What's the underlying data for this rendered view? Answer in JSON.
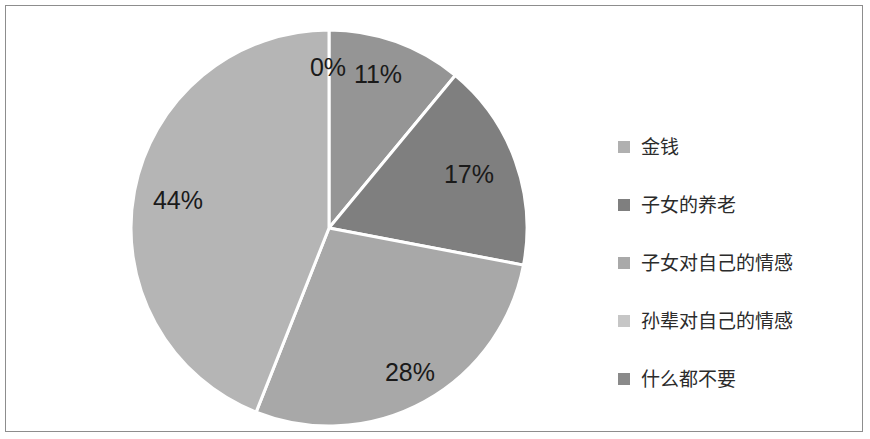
{
  "figure": {
    "background": "#ffffff",
    "border_color": "#8d8d8d"
  },
  "legend": {
    "position": "right",
    "items": [
      {
        "label": "金钱",
        "color": "#b0b0b0",
        "name": "legend-item-money"
      },
      {
        "label": "子女的养老",
        "color": "#7f7f7f",
        "name": "legend-item-children-eldercare"
      },
      {
        "label": "子女对自己的情感",
        "color": "#a9a9a9",
        "name": "legend-item-children-affection"
      },
      {
        "label": "孙辈对自己的情感",
        "color": "#c6c6c6",
        "name": "legend-item-grandchildren-affection"
      },
      {
        "label": "什么都不要",
        "color": "#8a8a8a",
        "name": "legend-item-nothing"
      }
    ]
  },
  "chart_data": {
    "type": "pie",
    "title": "",
    "subtitle": "",
    "xlabel": "",
    "ylabel": "",
    "grid": false,
    "legend_position": "right",
    "start_angle_deg": 0,
    "direction": "clockwise",
    "label_format": "percent",
    "categories": [
      "金钱",
      "子女的养老",
      "子女对自己的情感",
      "孙辈对自己的情感",
      "什么都不要"
    ],
    "values": [
      11,
      17,
      28,
      44,
      0
    ],
    "labels": [
      "11%",
      "17%",
      "28%",
      "44%",
      "0%"
    ],
    "colors": [
      "#959595",
      "#7f7f7f",
      "#a8a8a8",
      "#b5b5b5",
      "#8a8a8a"
    ],
    "slice_label_positions": [
      {
        "label": "11%",
        "x": 372,
        "y": 70
      },
      {
        "label": "17%",
        "x": 463,
        "y": 170
      },
      {
        "label": "28%",
        "x": 404,
        "y": 368
      },
      {
        "label": "44%",
        "x": 172,
        "y": 196
      },
      {
        "label": "0%",
        "x": 322,
        "y": 63
      }
    ],
    "geometry": {
      "center_x": 323,
      "center_y": 222,
      "radius": 198,
      "slice_border_color": "#ffffff",
      "slice_border_width": 3
    }
  }
}
